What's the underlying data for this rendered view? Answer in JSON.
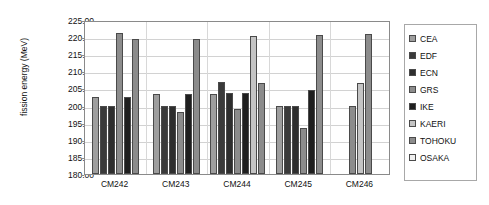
{
  "chart_data": {
    "type": "bar",
    "title": "",
    "xlabel": "",
    "ylabel": "fission energy (MeV)",
    "ylim": [
      180.0,
      225.0
    ],
    "ytick_step": 5.0,
    "yticks": [
      "225.00",
      "220.00",
      "215.00",
      "210.00",
      "205.00",
      "200.00",
      "195.00",
      "190.00",
      "185.00",
      "180.00"
    ],
    "grid": true,
    "legend_position": "right",
    "categories": [
      "CM242",
      "CM243",
      "CM244",
      "CM245",
      "CM246"
    ],
    "series": [
      {
        "name": "CEA",
        "color": "#9e9e9e",
        "values": [
          202.5,
          203.5,
          203.3,
          200.0,
          null
        ]
      },
      {
        "name": "EDF",
        "color": "#3a3a3a",
        "values": [
          200.0,
          200.0,
          206.8,
          200.0,
          null
        ]
      },
      {
        "name": "ECN",
        "color": "#2e2e2e",
        "values": [
          200.0,
          200.0,
          203.8,
          200.0,
          null
        ]
      },
      {
        "name": "GRS",
        "color": "#8c8c8c",
        "values": [
          221.3,
          198.0,
          199.0,
          193.5,
          199.8
        ]
      },
      {
        "name": "IKE",
        "color": "#1f1f1f",
        "values": [
          202.5,
          203.5,
          203.8,
          204.5,
          null
        ]
      },
      {
        "name": "KAERI",
        "color": "#c4c4c4",
        "values": [
          null,
          null,
          220.3,
          null,
          206.5
        ]
      },
      {
        "name": "TOHOKU",
        "color": "#8c8c8c",
        "values": [
          219.5,
          219.5,
          206.5,
          220.5,
          221.0
        ]
      },
      {
        "name": "OSAKA",
        "color": "#efefef",
        "values": [
          null,
          null,
          null,
          null,
          null
        ]
      }
    ]
  },
  "legend": {
    "items": [
      {
        "label": "CEA"
      },
      {
        "label": "EDF"
      },
      {
        "label": "ECN"
      },
      {
        "label": "GRS"
      },
      {
        "label": "IKE"
      },
      {
        "label": "KAERI"
      },
      {
        "label": "TOHOKU"
      },
      {
        "label": "OSAKA"
      }
    ]
  }
}
